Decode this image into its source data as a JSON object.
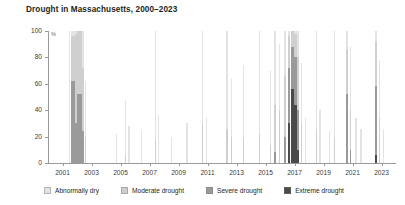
{
  "chart_data": {
    "type": "area",
    "title": "Drought in Massachusetts, 2000–2023",
    "xlabel": "",
    "ylabel": "%",
    "ylim": [
      0,
      100
    ],
    "xlim": [
      2000,
      2024
    ],
    "grid": false,
    "legend_position": "bottom",
    "yticks": [
      0,
      20,
      40,
      60,
      80,
      100
    ],
    "ytick_labels": [
      "0",
      "20",
      "40",
      "60",
      "80",
      "100"
    ],
    "xticks": [
      2001,
      2003,
      2005,
      2007,
      2009,
      2011,
      2013,
      2015,
      2017,
      2019,
      2021,
      2023
    ],
    "xtick_labels": [
      "2001",
      "2003",
      "2005",
      "2007",
      "2009",
      "2011",
      "2013",
      "2015",
      "2017",
      "2019",
      "2021",
      "2023"
    ],
    "series": [
      {
        "name": "Abnormally dry",
        "color": "#e3e3e3"
      },
      {
        "name": "Moderate drought",
        "color": "#cfcfcf"
      },
      {
        "name": "Severe drought",
        "color": "#9a9a9a"
      },
      {
        "name": "Extreme drought",
        "color": "#4a4a4a"
      }
    ],
    "points": [
      {
        "x": 2001.45,
        "w": 0.1,
        "d0": 100,
        "d1": 0,
        "d2": 0,
        "d3": 0
      },
      {
        "x": 2001.6,
        "w": 0.26,
        "d0": 100,
        "d1": 96,
        "d2": 62,
        "d3": 0
      },
      {
        "x": 2001.86,
        "w": 0.14,
        "d0": 100,
        "d1": 98,
        "d2": 30,
        "d3": 0
      },
      {
        "x": 2002.02,
        "w": 0.3,
        "d0": 100,
        "d1": 100,
        "d2": 52,
        "d3": 0
      },
      {
        "x": 2002.34,
        "w": 0.16,
        "d0": 100,
        "d1": 72,
        "d2": 24,
        "d3": 0
      },
      {
        "x": 2002.52,
        "w": 0.1,
        "d0": 62,
        "d1": 20,
        "d2": 0,
        "d3": 0
      },
      {
        "x": 2004.7,
        "w": 0.08,
        "d0": 22,
        "d1": 0,
        "d2": 0,
        "d3": 0
      },
      {
        "x": 2005.3,
        "w": 0.1,
        "d0": 48,
        "d1": 6,
        "d2": 0,
        "d3": 0
      },
      {
        "x": 2005.55,
        "w": 0.08,
        "d0": 28,
        "d1": 0,
        "d2": 0,
        "d3": 0
      },
      {
        "x": 2006.4,
        "w": 0.08,
        "d0": 24,
        "d1": 0,
        "d2": 0,
        "d3": 0
      },
      {
        "x": 2007.35,
        "w": 0.1,
        "d0": 100,
        "d1": 18,
        "d2": 0,
        "d3": 0
      },
      {
        "x": 2007.6,
        "w": 0.08,
        "d0": 36,
        "d1": 0,
        "d2": 0,
        "d3": 0
      },
      {
        "x": 2008.5,
        "w": 0.08,
        "d0": 20,
        "d1": 0,
        "d2": 0,
        "d3": 0
      },
      {
        "x": 2009.55,
        "w": 0.08,
        "d0": 30,
        "d1": 0,
        "d2": 0,
        "d3": 0
      },
      {
        "x": 2010.6,
        "w": 0.12,
        "d0": 100,
        "d1": 30,
        "d2": 0,
        "d3": 0
      },
      {
        "x": 2010.9,
        "w": 0.08,
        "d0": 34,
        "d1": 0,
        "d2": 0,
        "d3": 0
      },
      {
        "x": 2012.3,
        "w": 0.1,
        "d0": 100,
        "d1": 26,
        "d2": 0,
        "d3": 0
      },
      {
        "x": 2012.62,
        "w": 0.1,
        "d0": 64,
        "d1": 20,
        "d2": 0,
        "d3": 0
      },
      {
        "x": 2013.45,
        "w": 0.1,
        "d0": 74,
        "d1": 18,
        "d2": 0,
        "d3": 0
      },
      {
        "x": 2014.55,
        "w": 0.1,
        "d0": 100,
        "d1": 22,
        "d2": 0,
        "d3": 0
      },
      {
        "x": 2015.3,
        "w": 0.1,
        "d0": 70,
        "d1": 14,
        "d2": 0,
        "d3": 0
      },
      {
        "x": 2015.6,
        "w": 0.1,
        "d0": 100,
        "d1": 44,
        "d2": 8,
        "d3": 0
      },
      {
        "x": 2015.9,
        "w": 0.1,
        "d0": 90,
        "d1": 40,
        "d2": 0,
        "d3": 0
      },
      {
        "x": 2016.3,
        "w": 0.12,
        "d0": 100,
        "d1": 66,
        "d2": 20,
        "d3": 0
      },
      {
        "x": 2016.52,
        "w": 0.18,
        "d0": 100,
        "d1": 96,
        "d2": 72,
        "d3": 30
      },
      {
        "x": 2016.74,
        "w": 0.22,
        "d0": 100,
        "d1": 100,
        "d2": 88,
        "d3": 56
      },
      {
        "x": 2016.98,
        "w": 0.2,
        "d0": 100,
        "d1": 98,
        "d2": 80,
        "d3": 44
      },
      {
        "x": 2017.2,
        "w": 0.14,
        "d0": 100,
        "d1": 80,
        "d2": 40,
        "d3": 10
      },
      {
        "x": 2017.42,
        "w": 0.1,
        "d0": 76,
        "d1": 30,
        "d2": 0,
        "d3": 0
      },
      {
        "x": 2017.7,
        "w": 0.08,
        "d0": 34,
        "d1": 0,
        "d2": 0,
        "d3": 0
      },
      {
        "x": 2018.45,
        "w": 0.1,
        "d0": 100,
        "d1": 26,
        "d2": 0,
        "d3": 0
      },
      {
        "x": 2018.72,
        "w": 0.08,
        "d0": 40,
        "d1": 0,
        "d2": 0,
        "d3": 0
      },
      {
        "x": 2019.4,
        "w": 0.08,
        "d0": 24,
        "d1": 0,
        "d2": 0,
        "d3": 0
      },
      {
        "x": 2019.7,
        "w": 0.1,
        "d0": 100,
        "d1": 20,
        "d2": 0,
        "d3": 0
      },
      {
        "x": 2020.55,
        "w": 0.14,
        "d0": 100,
        "d1": 86,
        "d2": 52,
        "d3": 0
      },
      {
        "x": 2020.82,
        "w": 0.1,
        "d0": 88,
        "d1": 40,
        "d2": 10,
        "d3": 0
      },
      {
        "x": 2021.2,
        "w": 0.08,
        "d0": 34,
        "d1": 0,
        "d2": 0,
        "d3": 0
      },
      {
        "x": 2021.55,
        "w": 0.08,
        "d0": 26,
        "d1": 0,
        "d2": 0,
        "d3": 0
      },
      {
        "x": 2022.55,
        "w": 0.16,
        "d0": 100,
        "d1": 92,
        "d2": 58,
        "d3": 6
      },
      {
        "x": 2022.8,
        "w": 0.1,
        "d0": 78,
        "d1": 34,
        "d2": 0,
        "d3": 0
      },
      {
        "x": 2023.1,
        "w": 0.08,
        "d0": 26,
        "d1": 0,
        "d2": 0,
        "d3": 0
      }
    ]
  },
  "legend": {
    "items": [
      {
        "label": "Abnormally dry"
      },
      {
        "label": "Moderate drought"
      },
      {
        "label": "Severe drought"
      },
      {
        "label": "Extreme drought"
      }
    ]
  }
}
